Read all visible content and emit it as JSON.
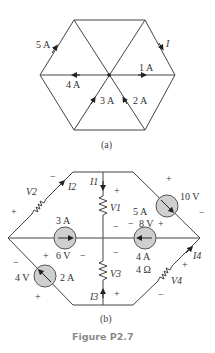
{
  "figure": {
    "caption": "Figure P2.7",
    "caption_color": "#8a8a8a"
  },
  "part_a": {
    "label": "(a)",
    "currents": {
      "upper_left_edge": "5 A",
      "left_spoke": "4 A",
      "right_spoke": "1 A",
      "lower_left_spoke": "3 A",
      "lower_right_spoke": "2 A",
      "upper_right_edge": "I"
    }
  },
  "part_b": {
    "label": "(b)",
    "elements": {
      "v2_resistor": {
        "voltage": "V2",
        "current": "I2",
        "plus": "+",
        "minus": "−"
      },
      "v1_resistor": {
        "voltage": "V1",
        "current": "I1",
        "plus": "+",
        "minus": "−"
      },
      "v3_resistor": {
        "voltage": "V3",
        "current": "I3",
        "plus": "+",
        "minus": "−"
      },
      "v4_resistor": {
        "voltage": "V4",
        "current": "I4",
        "resistance": "4 Ω",
        "plus": "+",
        "minus": "−"
      },
      "source_3a": {
        "current": "3 A",
        "voltage": "6 V",
        "plus": "+",
        "minus": "−"
      },
      "source_2a": {
        "current": "2 A",
        "voltage": "4 V",
        "plus": "+",
        "minus": "−"
      },
      "source_5a": {
        "current": "5 A",
        "voltage": "10 V",
        "plus": "+",
        "minus": "−"
      },
      "source_4a": {
        "current": "4 A",
        "voltage": "8 V",
        "plus": "+",
        "minus": "−"
      }
    }
  }
}
